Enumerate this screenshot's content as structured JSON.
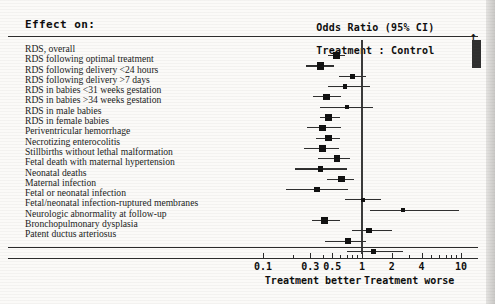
{
  "header": {
    "effect_on_label": "Effect on:",
    "axis_title_line1": "Odds Ratio (95% CI)",
    "axis_title_line2": "Treatment : Control"
  },
  "axis": {
    "tick_labels": [
      "0.1",
      "0.3",
      "0.5",
      "1",
      "2",
      "4",
      "10"
    ],
    "tick_values": [
      0.1,
      0.3,
      0.5,
      1,
      2,
      4,
      10
    ],
    "minor_ticks": [
      0.2,
      0.4,
      0.6,
      0.7,
      0.8,
      0.9,
      3,
      5,
      6,
      7,
      8,
      9
    ],
    "left_direction_label": "Treatment better",
    "right_direction_label": "Treatment worse",
    "scale": "log",
    "xlim": [
      0.08,
      13
    ],
    "reference_value": 1
  },
  "colors": {
    "marker": "#101010",
    "ci_line": "#2e2e2e",
    "reference_line": "#3a3a3a",
    "rule": "#2a2a2a",
    "background": "#fbfaf8",
    "text": "#1a1a1a"
  },
  "chart_data": {
    "type": "scatter",
    "title": "Odds Ratio (95% CI)  Treatment : Control",
    "subtitle": "Effect on:",
    "xlabel": "Odds Ratio (95% CI)",
    "ylabel": "Effect on:",
    "xscale": "log",
    "xlim": [
      0.08,
      13
    ],
    "reference_line": 1,
    "grid": false,
    "legend": "none",
    "annotations": [
      "Treatment better",
      "Treatment worse"
    ],
    "rows": [
      {
        "label": "RDS, overall",
        "or": 0.55,
        "ci_low": 0.45,
        "ci_high": 0.68,
        "weight": 3
      },
      {
        "label": "RDS following optimal treatment",
        "or": 0.38,
        "ci_low": 0.27,
        "ci_high": 0.52,
        "weight": 4
      },
      {
        "label": "RDS following delivery <24 hours",
        "or": 0.8,
        "ci_low": 0.58,
        "ci_high": 1.1,
        "weight": 2
      },
      {
        "label": "RDS following delivery >7 days",
        "or": 0.68,
        "ci_low": 0.45,
        "ci_high": 1.2,
        "weight": 1
      },
      {
        "label": "RDS in babies <31 weeks gestation",
        "or": 0.44,
        "ci_low": 0.32,
        "ci_high": 0.62,
        "weight": 3
      },
      {
        "label": "RDS in babies >34 weeks gestation",
        "or": 0.7,
        "ci_low": 0.38,
        "ci_high": 1.3,
        "weight": 1
      },
      {
        "label": "RDS in male babies",
        "or": 0.46,
        "ci_low": 0.38,
        "ci_high": 0.6,
        "weight": 3
      },
      {
        "label": "RDS in female babies",
        "or": 0.4,
        "ci_low": 0.28,
        "ci_high": 0.62,
        "weight": 3
      },
      {
        "label": "Periventricular hemorrhage",
        "or": 0.46,
        "ci_low": 0.34,
        "ci_high": 0.6,
        "weight": 3
      },
      {
        "label": "Necrotizing enterocolitis",
        "or": 0.4,
        "ci_low": 0.26,
        "ci_high": 0.58,
        "weight": 3
      },
      {
        "label": "Stillbirths without lethal malformation",
        "or": 0.56,
        "ci_low": 0.36,
        "ci_high": 0.76,
        "weight": 3
      },
      {
        "label": "Fetal death with maternal hypertension",
        "or": 0.38,
        "ci_low": 0.21,
        "ci_high": 0.7,
        "weight": 2
      },
      {
        "label": "Neonatal deaths",
        "or": 0.62,
        "ci_low": 0.44,
        "ci_high": 0.84,
        "weight": 3
      },
      {
        "label": "Maternal infection",
        "or": 0.35,
        "ci_low": 0.17,
        "ci_high": 0.72,
        "weight": 2
      },
      {
        "label": "Fetal or neonatal infection",
        "or": 1.02,
        "ci_low": 0.68,
        "ci_high": 1.55,
        "weight": 1
      },
      {
        "label": "Fetal/neonatal infection-ruptured membranes",
        "or": 2.6,
        "ci_low": 1.2,
        "ci_high": 9.5,
        "weight": 1
      },
      {
        "label": "Neurologic abnormality at follow-up",
        "or": 0.42,
        "ci_low": 0.31,
        "ci_high": 0.6,
        "weight": 4
      },
      {
        "label": "Bronchopulmonary dysplasia",
        "or": 1.18,
        "ci_low": 0.8,
        "ci_high": 2.0,
        "weight": 2
      },
      {
        "label": "Patent ductus arteriosus",
        "or": 0.72,
        "ci_low": 0.42,
        "ci_high": 1.1,
        "weight": 2
      },
      {
        "label": "",
        "or": 1.3,
        "ci_low": 0.7,
        "ci_high": 2.6,
        "weight": 2
      }
    ]
  }
}
